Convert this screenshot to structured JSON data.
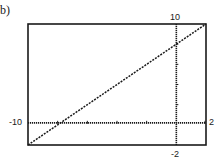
{
  "figure": {
    "part_label": "b)"
  },
  "chart_data": {
    "type": "line",
    "title": "",
    "xlabel": "",
    "ylabel": "",
    "xlim": [
      -10,
      2
    ],
    "ylim": [
      -2,
      10
    ],
    "x_tick_step": 2,
    "y_tick_step": 2,
    "grid": false,
    "window_labels": {
      "xmin": "-10",
      "xmax": "2",
      "ymin": "-2",
      "ymax": "10"
    },
    "series": [
      {
        "name": "y = x + 8",
        "style": "dotted",
        "x": [
          -10,
          -8,
          0,
          2
        ],
        "y": [
          -2,
          0,
          8,
          10
        ]
      }
    ],
    "annotations": []
  },
  "colors": {
    "frame": "#1a1a1a",
    "plot": "#1a1a1a",
    "background": "#ffffff"
  }
}
